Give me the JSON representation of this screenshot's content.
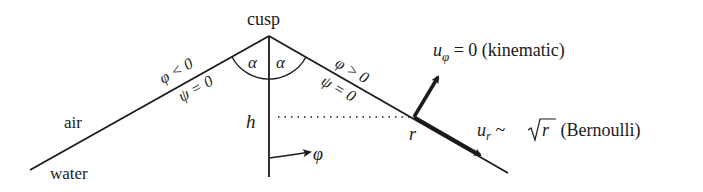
{
  "labels": {
    "cusp": "cusp",
    "air": "air",
    "water": "water",
    "alpha_left": "α",
    "alpha_right": "α",
    "phi_left": "φ < 0",
    "psi_left": "ψ = 0",
    "phi_right": "φ > 0",
    "psi_right": "ψ = 0",
    "h": "h",
    "varphi": "φ",
    "r": "r",
    "u_phi_symbol": "u",
    "u_phi_sub": "φ",
    "u_phi_rest": " = 0 (kinematic)",
    "u_r_symbol": "u",
    "u_r_sub": "r",
    "u_r_sim": " ~ ",
    "u_r_sqrt_arg": "r",
    "u_r_rest": " (Bernoulli)"
  },
  "colors": {
    "stroke": "#1a1a1a",
    "background": "#ffffff"
  }
}
